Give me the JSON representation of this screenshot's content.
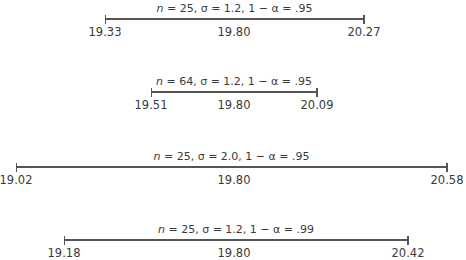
{
  "chart_data": {
    "type": "interval",
    "intervals": [
      {
        "caption": "n = 25, σ = 1.2, 1 − α = .95",
        "n": 25,
        "sigma": 1.2,
        "confidence": 0.95,
        "lower": "19.33",
        "mean": "19.80",
        "upper": "20.27",
        "x1": 105,
        "x2": 364,
        "y": 19
      },
      {
        "caption": "n = 64, σ = 1.2, 1 − α = .95",
        "n": 64,
        "sigma": 1.2,
        "confidence": 0.95,
        "lower": "19.51",
        "mean": "19.80",
        "upper": "20.09",
        "x1": 151,
        "x2": 317,
        "y": 92
      },
      {
        "caption": "n = 25, σ = 2.0, 1 − α = .95",
        "n": 25,
        "sigma": 2.0,
        "confidence": 0.95,
        "lower": "19.02",
        "mean": "19.80",
        "upper": "20.58",
        "x1": 16,
        "x2": 447,
        "y": 167
      },
      {
        "caption": "n = 25, σ = 1.2, 1 − α = .99",
        "n": 25,
        "sigma": 1.2,
        "confidence": 0.99,
        "lower": "19.18",
        "mean": "19.80",
        "upper": "20.42",
        "x1": 64,
        "x2": 408,
        "y": 240
      }
    ]
  }
}
